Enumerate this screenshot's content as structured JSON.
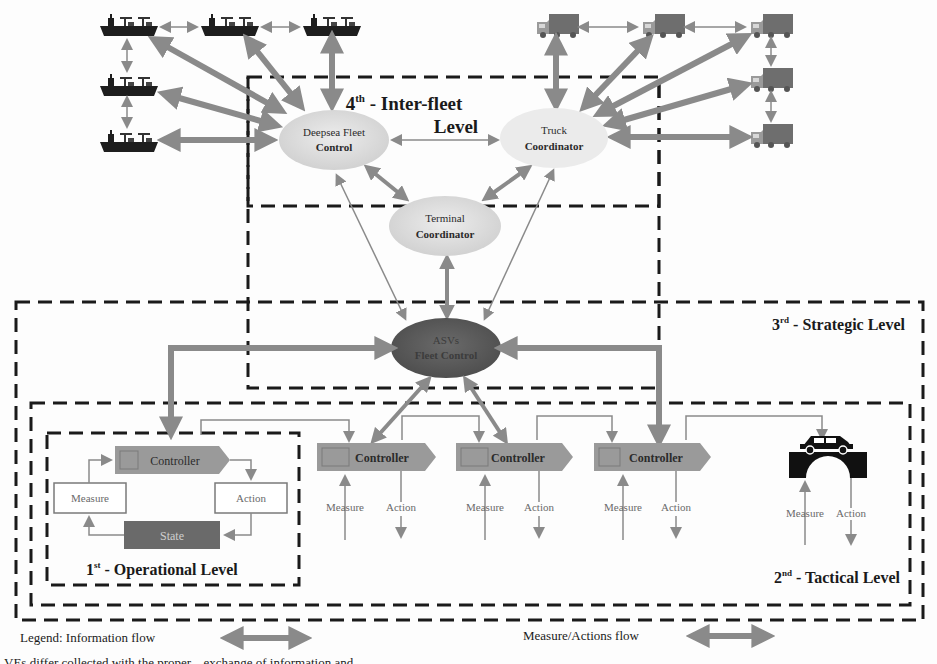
{
  "levels": {
    "inter_fleet": {
      "number": "4",
      "suffix": "th",
      "label": " - Inter-fleet",
      "label2": "Level"
    },
    "strategic": {
      "number": "3",
      "suffix": "rd",
      "label": " - Strategic Level"
    },
    "tactical": {
      "number": "2",
      "suffix": "nd",
      "label": " - Tactical Level"
    },
    "operational": {
      "number": "1",
      "suffix": "st",
      "label": " - Operational Level"
    }
  },
  "nodes": {
    "deepsea": {
      "line1": "Deepsea Fleet",
      "line2": "Control",
      "color": "#d4d4d4"
    },
    "truck": {
      "line1": "Truck",
      "line2": "Coordinator",
      "color": "#e6e6e6"
    },
    "terminal": {
      "line1": "Terminal",
      "line2": "Coordinator",
      "color": "#dadada"
    },
    "asv": {
      "line1": "ASVs",
      "line2": "Fleet Control",
      "color": "#5e5e5e"
    }
  },
  "operational": {
    "controller": "Controller",
    "measure": "Measure",
    "action": "Action",
    "state": "State"
  },
  "tactical": {
    "controllers": [
      {
        "label": "Controller",
        "measure": "Measure",
        "action": "Action"
      },
      {
        "label": "Controller",
        "measure": "Measure",
        "action": "Action"
      },
      {
        "label": "Controller",
        "measure": "Measure",
        "action": "Action"
      }
    ],
    "vehicle": {
      "icon": "car-on-bridge-icon",
      "measure": "Measure",
      "action": "Action"
    }
  },
  "fleets": {
    "ships": {
      "icon": "ship-icon",
      "count": 5
    },
    "trucks": {
      "icon": "truck-icon",
      "count": 5
    }
  },
  "legend": {
    "label": "Legend: Information flow",
    "measure_actions": "Measure/Actions flow"
  },
  "footer_clipped": "VEs differ collected with the proper... exchange of information and"
}
